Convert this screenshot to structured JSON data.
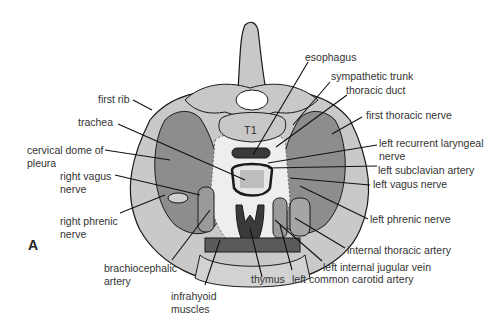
{
  "figure": {
    "panel_label": "A",
    "colors": {
      "bone": "#c8c8c8",
      "outer_ring": "#c9c9c9",
      "lung_dome": "#8d8d8d",
      "vessel": "#9a9a9a",
      "dark_muscle": "#3a3a3a",
      "outline": "#1a1a1a",
      "text": "#333333",
      "vertebra_label": "T1"
    },
    "vertebra_label": "T1",
    "labels_left": [
      {
        "id": "first-rib",
        "text": "first rib"
      },
      {
        "id": "trachea",
        "text": "trachea"
      },
      {
        "id": "cervical-dome",
        "line1": "cervical dome of",
        "line2": "pleura"
      },
      {
        "id": "right-vagus",
        "line1": "right vagus",
        "line2": "nerve"
      },
      {
        "id": "right-phrenic",
        "line1": "right phrenic",
        "line2": "nerve"
      }
    ],
    "labels_bottom": [
      {
        "id": "brachiocephalic",
        "line1": "brachiocephalic",
        "line2": "artery"
      },
      {
        "id": "infrahyoid",
        "line1": "infrahyoid",
        "line2": "muscles"
      },
      {
        "id": "thymus",
        "text": "thymus"
      },
      {
        "id": "left-common-carotid",
        "text": "left common carotid artery"
      }
    ],
    "labels_right": [
      {
        "id": "esophagus",
        "text": "esophagus"
      },
      {
        "id": "sympathetic-trunk",
        "text": "sympathetic trunk"
      },
      {
        "id": "thoracic-duct",
        "text": "thoracic duct"
      },
      {
        "id": "first-thoracic-nerve",
        "text": "first thoracic nerve"
      },
      {
        "id": "left-recurrent",
        "line1": "left recurrent laryngeal",
        "line2": "nerve"
      },
      {
        "id": "left-subclavian",
        "text": "left subclavian artery"
      },
      {
        "id": "left-vagus",
        "text": "left vagus nerve"
      },
      {
        "id": "left-phrenic",
        "text": "left phrenic nerve"
      },
      {
        "id": "internal-thoracic",
        "text": "internal thoracic artery"
      },
      {
        "id": "left-ijv",
        "text": "left internal jugular vein"
      }
    ]
  }
}
